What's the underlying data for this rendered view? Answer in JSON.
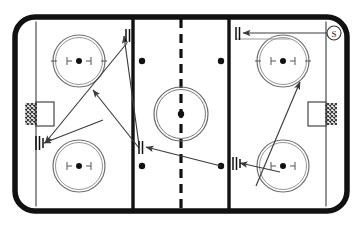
{
  "diagram": {
    "sport": "ice-hockey",
    "surface_color": "#ffffff",
    "boundary_color": "#111111",
    "line_color": "#3a3a3a",
    "marking_color": "#555555",
    "arrow_color": "#3c3c3c",
    "label_color": "#2a2a2a"
  },
  "rink": {
    "board_outline": {
      "x": 12,
      "y": 14,
      "width": 338,
      "height": 200,
      "corner_radius": 22,
      "stroke_width": 6
    },
    "goal_lines": [
      {
        "name": "goal-line-left",
        "x": 36
      },
      {
        "name": "goal-line-right",
        "x": 326
      }
    ],
    "blue_lines": [
      {
        "name": "blue-line-left",
        "x": 133
      },
      {
        "name": "blue-line-right",
        "x": 229
      }
    ],
    "center_line": {
      "name": "center-line",
      "x": 181,
      "dashed": true
    },
    "center_circle": {
      "cx": 181,
      "cy": 114,
      "r": 27,
      "dot_r": 3.2
    },
    "faceoff_circles": [
      {
        "name": "faceoff-circle-top-left",
        "cx": 79,
        "cy": 61,
        "r": 26
      },
      {
        "name": "faceoff-circle-bottom-left",
        "cx": 79,
        "cy": 166,
        "r": 26
      },
      {
        "name": "faceoff-circle-top-right",
        "cx": 283,
        "cy": 61,
        "r": 26
      },
      {
        "name": "faceoff-circle-bottom-right",
        "cx": 283,
        "cy": 166,
        "r": 26
      }
    ],
    "neutral_zone_dots": [
      {
        "name": "neutral-dot-top-left",
        "cx": 142,
        "cy": 61
      },
      {
        "name": "neutral-dot-top-right",
        "cx": 221,
        "cy": 61
      },
      {
        "name": "neutral-dot-bottom-left",
        "cx": 142,
        "cy": 166
      },
      {
        "name": "neutral-dot-bottom-right",
        "cx": 221,
        "cy": 166
      }
    ],
    "goals": [
      {
        "name": "goal-left",
        "x": 36,
        "y": 102,
        "width": 18,
        "height": 24,
        "side": "left"
      },
      {
        "name": "goal-right",
        "x": 308,
        "y": 102,
        "width": 18,
        "height": 24,
        "side": "right"
      }
    ]
  },
  "player_markers": [
    {
      "name": "player-marker-top-left",
      "x": 126,
      "y": 35,
      "strokes": 2,
      "label": ""
    },
    {
      "name": "player-marker-mid-left",
      "x": 38,
      "y": 143,
      "strokes": 3,
      "label": ""
    },
    {
      "name": "player-marker-mid-center",
      "x": 139,
      "y": 147,
      "strokes": 2,
      "label": ""
    },
    {
      "name": "player-marker-mid-right",
      "x": 233,
      "y": 163,
      "strokes": 3,
      "label": ""
    },
    {
      "name": "player-marker-top-right",
      "x": 236,
      "y": 33,
      "strokes": 2,
      "label": ""
    }
  ],
  "labels": [
    {
      "name": "shooter-label",
      "text": "S",
      "cx": 334,
      "cy": 33,
      "r": 7
    }
  ],
  "movement_paths": [
    {
      "name": "pass-path-top-left",
      "type": "pass",
      "from": {
        "x": 139,
        "y": 145
      },
      "to": {
        "x": 124,
        "y": 35
      },
      "arrow": "end"
    },
    {
      "name": "skate-path-left-crossing-up",
      "type": "skate",
      "from": {
        "x": 139,
        "y": 147
      },
      "to": {
        "x": 92,
        "y": 90
      },
      "arrow": "end"
    },
    {
      "name": "skate-path-left-crossing-down",
      "type": "skate",
      "from": {
        "x": 40,
        "y": 143
      },
      "to": {
        "x": 105,
        "y": 118
      },
      "arrow": "start"
    },
    {
      "name": "pass-path-bottom-left",
      "type": "pass",
      "from": {
        "x": 127,
        "y": 42
      },
      "to": {
        "x": 40,
        "y": 143
      },
      "arrow": "end"
    },
    {
      "name": "pass-path-center-to-left",
      "type": "pass",
      "from": {
        "x": 221,
        "y": 166
      },
      "to": {
        "x": 142,
        "y": 147
      },
      "arrow": "end"
    },
    {
      "name": "pass-path-right-to-center",
      "type": "pass",
      "from": {
        "x": 283,
        "y": 166
      },
      "to": {
        "x": 235,
        "y": 163
      },
      "arrow": "end"
    },
    {
      "name": "skate-path-right-diagonal",
      "type": "skate",
      "from": {
        "x": 258,
        "y": 183
      },
      "to": {
        "x": 300,
        "y": 80
      },
      "arrow": "end"
    },
    {
      "name": "pass-path-top-right",
      "type": "pass",
      "from": {
        "x": 327,
        "y": 33
      },
      "to": {
        "x": 239,
        "y": 33
      },
      "arrow": "end"
    }
  ]
}
